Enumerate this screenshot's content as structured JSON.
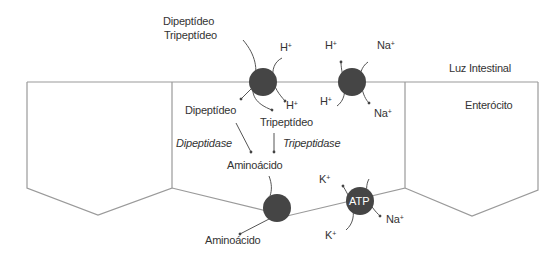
{
  "regions": {
    "lumen": "Luz Intestinal",
    "cell": "Enterócito"
  },
  "apical": {
    "substrate_line1": "Dipeptídeo",
    "substrate_line2": "Tripeptídeo",
    "cotransporter_ion_out": "H",
    "cotransporter_ion_in": "H",
    "exchanger_h_out": "H",
    "exchanger_na_out": "Na",
    "exchanger_h_in": "H",
    "exchanger_na_in": "Na",
    "plus": "+"
  },
  "cytoplasm": {
    "dipeptide": "Dipeptídeo",
    "tripeptide": "Tripeptídeo",
    "dipeptidase": "Dipeptidase",
    "tripeptidase": "Tripeptidase",
    "amino_acid": "Aminoácido"
  },
  "basolateral": {
    "amino_acid_out": "Aminoácido",
    "pump_label": "ATP",
    "k_in": "K",
    "k_out": "K",
    "na_out": "Na",
    "plus": "+"
  },
  "colors": {
    "membrane_line": "#9a9a9a",
    "transporter_fill": "#454545",
    "arrow": "#555555",
    "text": "#333333"
  }
}
